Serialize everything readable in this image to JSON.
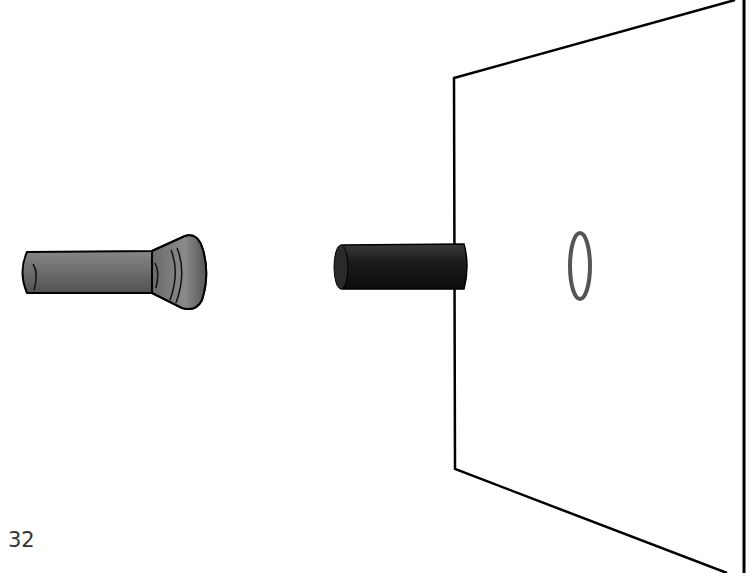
{
  "figure": {
    "objects": [
      {
        "id": "flashlight",
        "label": "flashlight"
      },
      {
        "id": "cylinder",
        "label": "opaque cylinder"
      },
      {
        "id": "screen",
        "label": "screen"
      },
      {
        "id": "shadow",
        "label": "ring shadow"
      }
    ],
    "colors": {
      "flashlight_body": "#6e6e6e",
      "cylinder": "#1e1e1e",
      "outline": "#000000",
      "shadow_ring": "#555555"
    }
  },
  "page": {
    "number": "32"
  }
}
